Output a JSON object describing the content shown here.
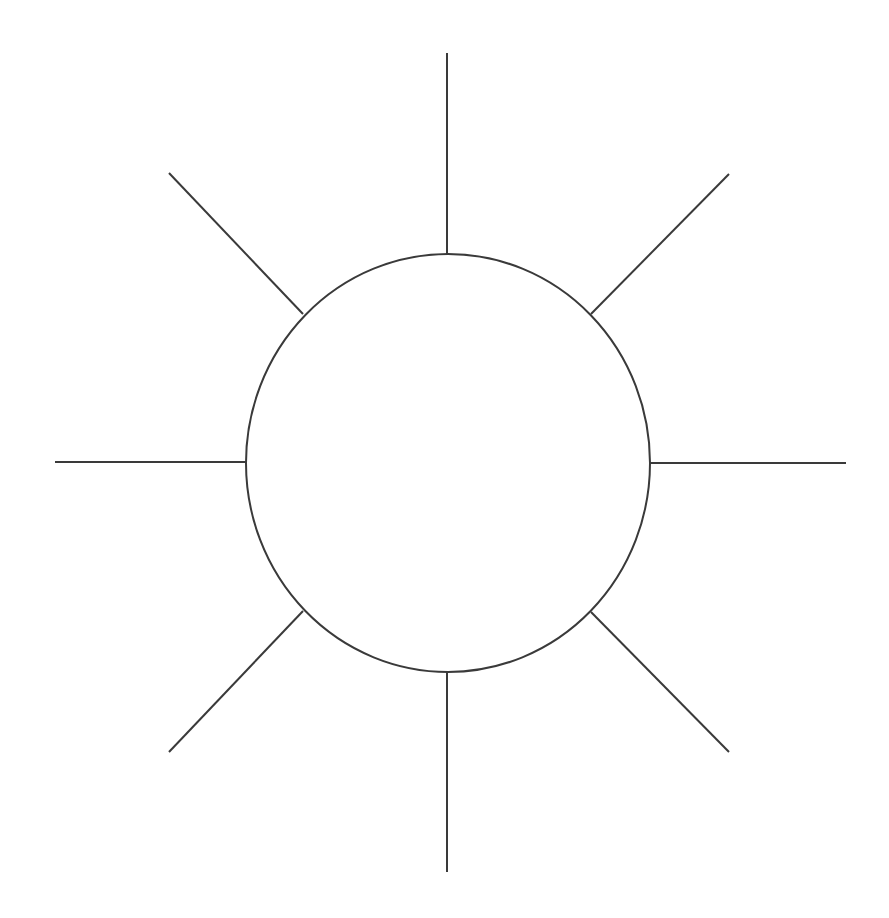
{
  "diagram": {
    "type": "sun-diagram",
    "background": "#ffffff",
    "stroke_color": "#3a3a3a",
    "stroke_width": 2,
    "center_shape": {
      "shape": "ellipse",
      "cx": 448,
      "cy": 463,
      "rx": 202,
      "ry": 209,
      "label": ""
    },
    "rays": [
      {
        "name": "ray-top",
        "x1": 447,
        "y1": 53,
        "x2": 447,
        "y2": 254,
        "label": ""
      },
      {
        "name": "ray-top-right",
        "x1": 591,
        "y1": 314,
        "x2": 729,
        "y2": 174,
        "label": ""
      },
      {
        "name": "ray-right",
        "x1": 650,
        "y1": 463,
        "x2": 846,
        "y2": 463,
        "label": ""
      },
      {
        "name": "ray-bottom-right",
        "x1": 591,
        "y1": 612,
        "x2": 729,
        "y2": 752,
        "label": ""
      },
      {
        "name": "ray-bottom",
        "x1": 447,
        "y1": 672,
        "x2": 447,
        "y2": 872,
        "label": ""
      },
      {
        "name": "ray-bottom-left",
        "x1": 303,
        "y1": 611,
        "x2": 169,
        "y2": 752,
        "label": ""
      },
      {
        "name": "ray-left",
        "x1": 55,
        "y1": 462,
        "x2": 246,
        "y2": 462,
        "label": ""
      },
      {
        "name": "ray-top-left",
        "x1": 169,
        "y1": 173,
        "x2": 303,
        "y2": 314,
        "label": ""
      }
    ]
  }
}
